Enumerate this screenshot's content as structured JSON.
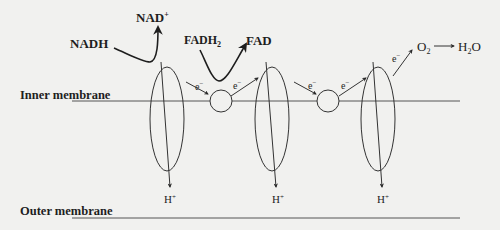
{
  "diagram": {
    "membranes": {
      "inner": "Inner membrane",
      "outer": "Outer membrane"
    },
    "donors": {
      "nadh": "NADH",
      "nad_plus": "NAD",
      "nad_plus_sup": "+",
      "fadh2": "FADH",
      "fadh2_sub": "2",
      "fad": "FAD"
    },
    "electron": {
      "symbol": "e",
      "charge": "−"
    },
    "acceptor": {
      "o2": "O",
      "o2_sub": "2",
      "water": "H",
      "water_sub": "2",
      "water_tail": "O"
    },
    "proton": {
      "symbol": "H",
      "charge": "+"
    },
    "complexes": [
      {
        "id": "complex-1",
        "cx": 167
      },
      {
        "id": "complex-2",
        "cx": 272
      },
      {
        "id": "complex-3",
        "cx": 378
      }
    ],
    "carriers": [
      {
        "id": "carrier-1",
        "cx": 221
      },
      {
        "id": "carrier-2",
        "cx": 328
      }
    ],
    "colors": {
      "line": "#333333",
      "text": "#1e1e1e",
      "background": "#f1f1ef"
    }
  }
}
